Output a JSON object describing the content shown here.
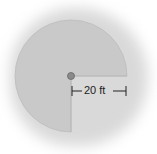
{
  "diagram": {
    "type": "three-quarter circle (sprinkler coverage region)",
    "radius_label": "20 ft",
    "center_marker": "sprinkler-head",
    "missing_sector": "bottom-right quadrant",
    "colors": {
      "region_fill": "#c9c9c9",
      "background_shadow": "#d9d9d9",
      "center_marker": "#8a8a8a",
      "line": "#222222"
    }
  }
}
